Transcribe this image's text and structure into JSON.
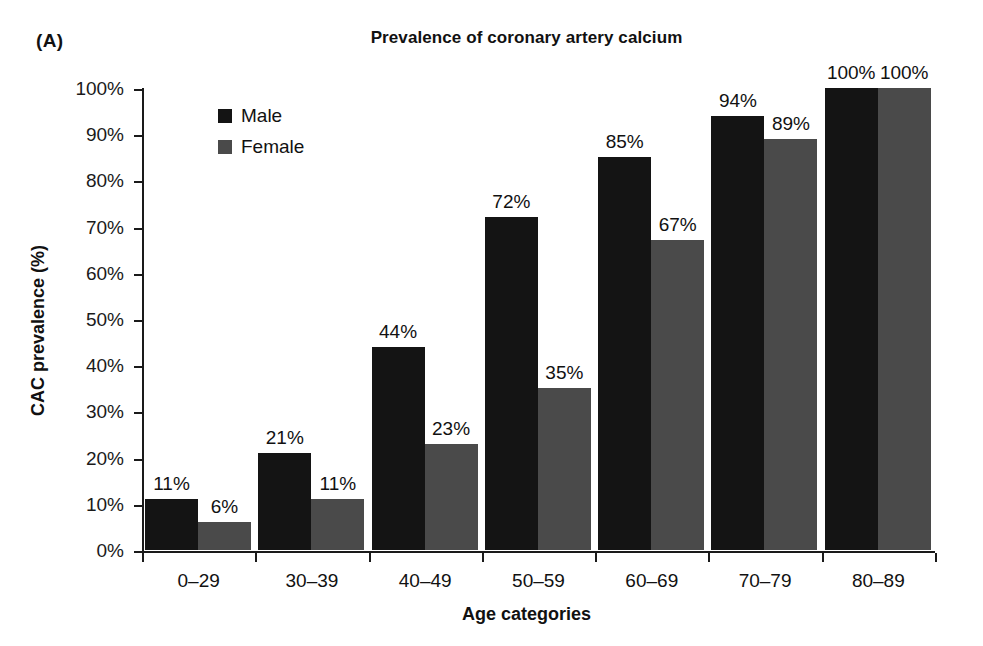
{
  "panel": {
    "label": "(A)"
  },
  "chart_data": {
    "type": "bar",
    "title": "Prevalence of coronary artery calcium",
    "xlabel": "Age categories",
    "ylabel": "CAC prevalence (%)",
    "categories": [
      "0–29",
      "30–39",
      "40–49",
      "50–59",
      "60–69",
      "70–79",
      "80–89"
    ],
    "series": [
      {
        "name": "Male",
        "color": "#141414",
        "values": [
          11,
          21,
          44,
          72,
          85,
          94,
          100
        ],
        "labels": [
          "11%",
          "21%",
          "44%",
          "72%",
          "85%",
          "94%",
          "100%"
        ]
      },
      {
        "name": "Female",
        "color": "#4a4a4a",
        "values": [
          6,
          11,
          23,
          35,
          67,
          89,
          100
        ],
        "labels": [
          "6%",
          "11%",
          "23%",
          "35%",
          "67%",
          "89%",
          "100%"
        ]
      }
    ],
    "ylim": [
      0,
      100
    ],
    "yticks": [
      0,
      10,
      20,
      30,
      40,
      50,
      60,
      70,
      80,
      90,
      100
    ],
    "ytick_labels": [
      "0%",
      "10%",
      "20%",
      "30%",
      "40%",
      "50%",
      "60%",
      "70%",
      "80%",
      "90%",
      "100%"
    ],
    "grid": false,
    "legend_position": "upper-left-inside",
    "legend": [
      "Male",
      "Female"
    ]
  }
}
